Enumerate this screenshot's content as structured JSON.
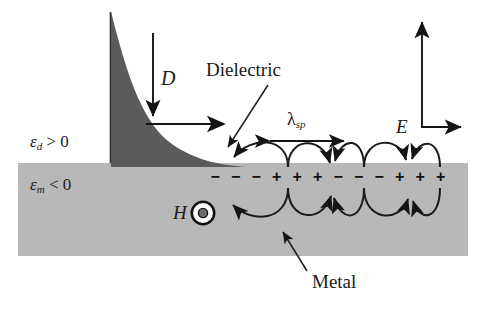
{
  "figure": {
    "type": "physics-schematic",
    "colors": {
      "metal_band": "#b8b8b8",
      "decay_curve_fill": "#5b5b5b",
      "ink": "#1a1a1a",
      "background": "#ffffff"
    }
  },
  "labels": {
    "dielectric": "Dielectric",
    "metal": "Metal",
    "epsilon_dielectric": {
      "symbol": "ε",
      "subscript": "d",
      "relation": "> 0"
    },
    "epsilon_metal": {
      "symbol": "ε",
      "subscript": "m",
      "relation": "< 0"
    },
    "displacement_field": "D",
    "electric_field": "E",
    "magnetic_field": "H",
    "wavelength": {
      "symbol": "λ",
      "subscript": "sp"
    }
  },
  "interface_charges": {
    "sequence": [
      "−",
      "−",
      "−",
      "+",
      "+",
      "+",
      "−",
      "−",
      "−",
      "+",
      "+",
      "+"
    ],
    "minus_glyph": "−",
    "plus_glyph": "+"
  },
  "annotations": {
    "magnetic_field_symbol": "out-of-page circle-dot",
    "field_loops": 3,
    "wavelength_span_px": 74
  }
}
